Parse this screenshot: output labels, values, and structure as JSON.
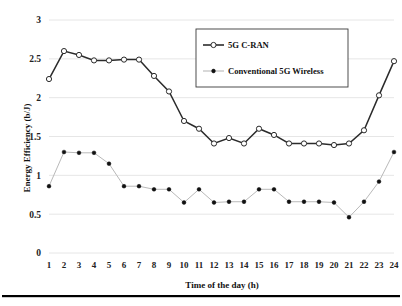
{
  "chart_data": {
    "type": "line",
    "title": "",
    "xlabel": "Time of the day (h)",
    "ylabel": "Energy Efficiency (b/J)",
    "x": [
      1,
      2,
      3,
      4,
      5,
      6,
      7,
      8,
      9,
      10,
      11,
      12,
      13,
      14,
      15,
      16,
      17,
      18,
      19,
      20,
      21,
      22,
      23,
      24
    ],
    "xtick_labels": [
      "1",
      "2",
      "3",
      "4",
      "5",
      "6",
      "7",
      "8",
      "9",
      "10",
      "11",
      "12",
      "13",
      "14",
      "15",
      "16",
      "17",
      "18",
      "19",
      "20",
      "21",
      "22",
      "23",
      "24"
    ],
    "ytick_labels": [
      "0",
      "0.5",
      "1",
      "1.5",
      "2",
      "2.5",
      "3"
    ],
    "ytick_values": [
      0,
      0.5,
      1,
      1.5,
      2,
      2.5,
      3
    ],
    "ylim": [
      0,
      3
    ],
    "xlim": [
      1,
      24
    ],
    "grid": "horizontal",
    "legend_position": "top-right-inside",
    "series": [
      {
        "name": "5G C-RAN",
        "marker": "open-circle",
        "color": "#2b2b2b",
        "values": [
          2.24,
          2.6,
          2.55,
          2.48,
          2.48,
          2.49,
          2.49,
          2.28,
          2.08,
          1.7,
          1.6,
          1.41,
          1.48,
          1.41,
          1.6,
          1.52,
          1.41,
          1.41,
          1.41,
          1.39,
          1.41,
          1.58,
          2.03,
          2.47
        ]
      },
      {
        "name": "Conventional 5G Wireless",
        "marker": "filled-circle",
        "color": "#111111",
        "values": [
          0.86,
          1.3,
          1.29,
          1.29,
          1.15,
          0.86,
          0.86,
          0.82,
          0.82,
          0.65,
          0.82,
          0.65,
          0.66,
          0.66,
          0.82,
          0.82,
          0.66,
          0.66,
          0.66,
          0.65,
          0.46,
          0.66,
          0.92,
          1.3
        ]
      }
    ]
  },
  "legend": {
    "entries": [
      {
        "label": "5G C-RAN"
      },
      {
        "label": "Conventional 5G Wireless"
      }
    ]
  },
  "colors": {
    "cran_line": "#2b2b2b",
    "conventional_line": "#b9b9b9",
    "conventional_marker": "#111111",
    "gridline": "#e3e3e3",
    "background": "#ffffff"
  }
}
